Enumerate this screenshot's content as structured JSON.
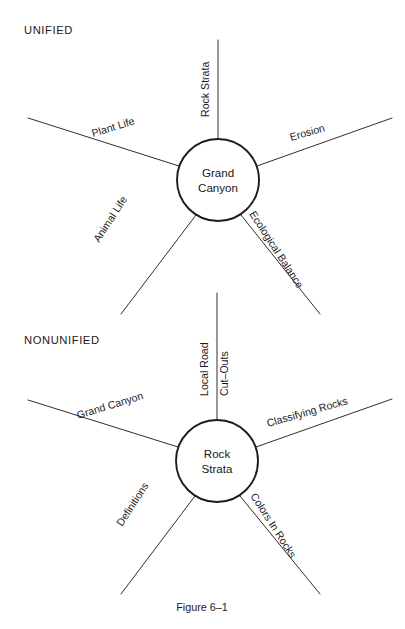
{
  "figure": {
    "caption": "Figure 6–1",
    "background_color": "#ffffff",
    "ink_color": "#1b1b1e"
  },
  "diagrams": [
    {
      "heading": "UNIFIED",
      "heading_pos": {
        "x": 24,
        "y": 34
      },
      "hub": {
        "line1": "Grand",
        "line2": "Canyon",
        "cx": 218,
        "cy": 180,
        "r": 41
      },
      "spokes": [
        {
          "label": "Rock Strata",
          "angle_deg": -90,
          "text_rotate": -90,
          "text_x": 209,
          "text_y": 117,
          "line_x1": 218,
          "line_y1": 139,
          "line_x2": 218,
          "line_y2": 40
        },
        {
          "label": "Plant Life",
          "angle_deg": -163,
          "text_rotate": -17,
          "text_x": 93,
          "text_y": 137,
          "line_x1": 179,
          "line_y1": 166,
          "line_x2": 28,
          "line_y2": 118
        },
        {
          "label": "Erosion",
          "angle_deg": -17,
          "text_rotate": -16,
          "text_x": 291,
          "text_y": 141,
          "line_x1": 257,
          "line_y1": 166,
          "line_x2": 392,
          "line_y2": 118
        },
        {
          "label": "Animal Life",
          "angle_deg": 123,
          "text_rotate": 57,
          "text_x": 99,
          "text_y": 243,
          "line_x1": 196,
          "line_y1": 215,
          "line_x2": 121,
          "line_y2": 314
        },
        {
          "label": "Ecological Balance",
          "angle_deg": 57,
          "text_rotate": 57,
          "text_x": 249,
          "text_y": 214,
          "line_x1": 241,
          "line_y1": 215,
          "line_x2": 320,
          "line_y2": 314
        }
      ]
    },
    {
      "heading": "NONUNIFIED",
      "heading_pos": {
        "x": 24,
        "y": 344
      },
      "hub": {
        "line1": "Rock",
        "line2": "Strata",
        "cx": 217,
        "cy": 461,
        "r": 41
      },
      "spokes": [
        {
          "label": "Local Road",
          "angle_deg": -90,
          "text_rotate": -90,
          "text_x": 208,
          "text_y": 396,
          "line_x1": 217,
          "line_y1": 420,
          "line_x2": 217,
          "line_y2": 293
        },
        {
          "label": "Cut–Outs",
          "angle_deg": -90,
          "text_rotate": -90,
          "text_x": 228,
          "text_y": 396,
          "line_x1": null,
          "line_y1": null,
          "line_x2": null,
          "line_y2": null
        },
        {
          "label": "Grand Canyon",
          "angle_deg": -163,
          "text_rotate": -17,
          "text_x": 78,
          "text_y": 419,
          "line_x1": 178,
          "line_y1": 447,
          "line_x2": 28,
          "line_y2": 400
        },
        {
          "label": "Classifying Rocks",
          "angle_deg": -17,
          "text_rotate": -16,
          "text_x": 268,
          "text_y": 427,
          "line_x1": 256,
          "line_y1": 447,
          "line_x2": 392,
          "line_y2": 399
        },
        {
          "label": "Definitions",
          "angle_deg": 123,
          "text_rotate": 57,
          "text_x": 122,
          "text_y": 527,
          "line_x1": 195,
          "line_y1": 496,
          "line_x2": 121,
          "line_y2": 594
        },
        {
          "label": "Colors In Rocks",
          "angle_deg": 57,
          "text_rotate": 57,
          "text_x": 250,
          "text_y": 496,
          "line_x1": 240,
          "line_y1": 496,
          "line_x2": 320,
          "line_y2": 594
        }
      ]
    }
  ],
  "caption_pos": {
    "x": 202,
    "y": 611
  }
}
